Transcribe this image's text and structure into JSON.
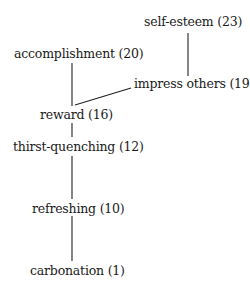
{
  "diagram": {
    "type": "hierarchical-value-map",
    "nodes": [
      {
        "id": "self-esteem",
        "label": "self-esteem (23)",
        "x": 144,
        "y": 15
      },
      {
        "id": "accomplishment",
        "label": "accomplishment (20)",
        "x": 14,
        "y": 47
      },
      {
        "id": "impress-others",
        "label": "impress others (19)",
        "x": 134,
        "y": 77
      },
      {
        "id": "reward",
        "label": "reward (16)",
        "x": 40,
        "y": 108
      },
      {
        "id": "thirst-quenching",
        "label": "thirst-quenching (12)",
        "x": 13,
        "y": 138
      },
      {
        "id": "refreshing",
        "label": "refreshing (10)",
        "x": 32,
        "y": 200
      },
      {
        "id": "carbonation",
        "label": "carbonation (1)",
        "x": 30,
        "y": 262
      }
    ],
    "edges": [
      {
        "from": "self-esteem",
        "to": "impress-others"
      },
      {
        "from": "accomplishment",
        "to": "reward"
      },
      {
        "from": "impress-others",
        "to": "reward"
      },
      {
        "from": "reward",
        "to": "thirst-quenching"
      },
      {
        "from": "thirst-quenching",
        "to": "refreshing"
      },
      {
        "from": "refreshing",
        "to": "carbonation"
      }
    ]
  }
}
